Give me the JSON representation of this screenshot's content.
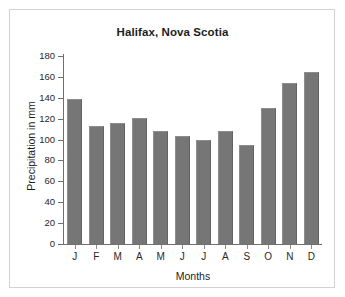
{
  "figure": {
    "title": "Halifax, Nova Scotia",
    "x_axis_title": "Months",
    "y_axis_title": "Precipitation in mm"
  },
  "colors": {
    "bar_fill": "#767676",
    "axis": "#6f6f6f",
    "frame": "#d2d2d2",
    "background": "#ffffff",
    "text": "#1d1d1d"
  },
  "chart_data": {
    "type": "bar",
    "title": "Halifax, Nova Scotia",
    "xlabel": "Months",
    "ylabel": "Precipitation in mm",
    "categories": [
      "J",
      "F",
      "M",
      "A",
      "M",
      "J",
      "J",
      "A",
      "S",
      "O",
      "N",
      "D"
    ],
    "category_names": [
      "January",
      "February",
      "March",
      "April",
      "May",
      "June",
      "July",
      "August",
      "September",
      "October",
      "November",
      "December"
    ],
    "values": [
      139,
      113,
      116,
      121,
      108,
      103,
      100,
      108,
      95,
      130,
      154,
      165
    ],
    "ylim": [
      0,
      180
    ],
    "ytick_step": 20,
    "yticks": [
      0,
      20,
      40,
      60,
      80,
      100,
      120,
      140,
      160,
      180
    ],
    "ytick_labels": [
      "0",
      "20",
      "40",
      "60",
      "80",
      "100",
      "120",
      "140",
      "160",
      "180"
    ],
    "grid": false,
    "legend": false,
    "units": "mm"
  }
}
